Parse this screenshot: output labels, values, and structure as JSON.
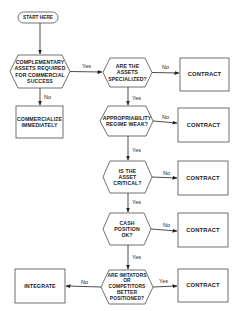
{
  "diagram": {
    "type": "flowchart",
    "nodes": {
      "start": {
        "label": "START HERE",
        "shape": "terminator"
      },
      "q1": {
        "label": "COMPLEMENTARY ASSETS REQUIRED FOR COMMERCIAL SUCCESS",
        "shape": "hexagon"
      },
      "commercialize": {
        "label": "COMMERCIALIZE IMMEDIATELY",
        "shape": "box"
      },
      "q2": {
        "label": "ARE THE ASSETS SPECIALIZED?",
        "shape": "hexagon"
      },
      "c1": {
        "label": "CONTRACT",
        "shape": "box"
      },
      "q3": {
        "label": "APPROPRIABILITY REGIME WEAK?",
        "shape": "hexagon"
      },
      "c2": {
        "label": "CONTRACT",
        "shape": "box"
      },
      "q4": {
        "label": "IS THE ASSET CRITICAL?",
        "shape": "hexagon"
      },
      "c3": {
        "label": "CONTRACT",
        "shape": "box"
      },
      "q5": {
        "label": "CASH POSITION OK?",
        "shape": "hexagon"
      },
      "c4": {
        "label": "CONTRACT",
        "shape": "box"
      },
      "q6": {
        "label": "ARE IMITATORS OR COMPETITORS BETTER POSITIONED?",
        "shape": "hexagon"
      },
      "c5": {
        "label": "CONTRACT",
        "shape": "box"
      },
      "integrate": {
        "label": "INTEGRATE",
        "shape": "box"
      }
    },
    "edges": {
      "q1_yes": "Yes",
      "q1_no": "No",
      "q2_no": "No",
      "q2_yes": "Yes",
      "q3_no": "No",
      "q3_yes": "Yes",
      "q4_no": "No",
      "q4_yes": "Yes",
      "q5_no": "No",
      "q5_yes": "Yes",
      "q6_no": "No",
      "q6_yes": "Yes"
    }
  }
}
